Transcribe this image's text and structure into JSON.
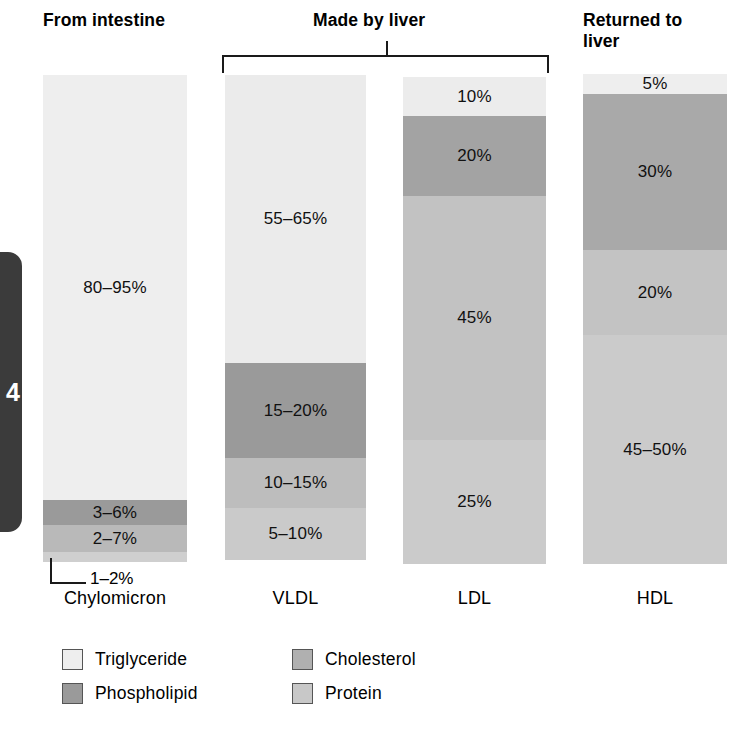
{
  "page_tab": {
    "number": "4"
  },
  "headings": {
    "intestine": "From intestine",
    "liver": "Made by liver",
    "returned": "Returned to\nliver"
  },
  "callout": {
    "label": "1–2%"
  },
  "captions": {
    "chylomicron": "Chylomicron",
    "vldl": "VLDL",
    "ldl": "LDL",
    "hdl": "HDL"
  },
  "legend": {
    "items": [
      {
        "label": "Triglyceride",
        "color": "#eeeeee"
      },
      {
        "label": "Cholesterol",
        "color": "#b0b0b0"
      },
      {
        "label": "Phospholipid",
        "color": "#9a9a9a"
      },
      {
        "label": "Protein",
        "color": "#c8c8c8"
      }
    ]
  },
  "chart_data": {
    "type": "bar",
    "xlabel": "",
    "ylabel": "Percent of particle mass",
    "ylim": [
      0,
      100
    ],
    "grid": false,
    "legend_position": "bottom",
    "categories": [
      "Chylomicron",
      "VLDL",
      "LDL",
      "HDL"
    ],
    "series": [
      {
        "name": "Triglyceride",
        "color": "#eeeeee",
        "labels": [
          "80–95%",
          "55–65%",
          "10%",
          "5%"
        ],
        "values": [
          87.5,
          60,
          10,
          5
        ]
      },
      {
        "name": "Phospholipid",
        "color": "#9a9a9a",
        "labels": [
          "3–6%",
          "15–20%",
          "20%",
          "30%"
        ],
        "values": [
          4.5,
          17.5,
          20,
          30
        ]
      },
      {
        "name": "Cholesterol",
        "color": "#b0b0b0",
        "labels": [
          "2–7%",
          "10–15%",
          "45%",
          "20%"
        ],
        "values": [
          4.5,
          12.5,
          45,
          20
        ]
      },
      {
        "name": "Protein",
        "color": "#c8c8c8",
        "labels": [
          "1–2%",
          "5–10%",
          "25%",
          "45–50%"
        ],
        "values": [
          1.5,
          7.5,
          25,
          47.5
        ]
      }
    ]
  },
  "bars": {
    "chylomicron": {
      "segments": [
        {
          "component": "Triglyceride",
          "label": "80–95%",
          "height_px": 425,
          "color": "#eeeeee"
        },
        {
          "component": "Phospholipid",
          "label": "3–6%",
          "height_px": 25,
          "color": "#9a9a9a"
        },
        {
          "component": "Cholesterol",
          "label": "2–7%",
          "height_px": 27,
          "color": "#b9b9b9"
        },
        {
          "component": "Protein",
          "label": "",
          "height_px": 10,
          "color": "#cfcfcf"
        }
      ]
    },
    "vldl": {
      "segments": [
        {
          "component": "Triglyceride",
          "label": "55–65%",
          "height_px": 288,
          "color": "#ebebeb"
        },
        {
          "component": "Phospholipid",
          "label": "15–20%",
          "height_px": 95,
          "color": "#9a9a9a"
        },
        {
          "component": "Cholesterol",
          "label": "10–15%",
          "height_px": 50,
          "color": "#bdbdbd"
        },
        {
          "component": "Protein",
          "label": "5–10%",
          "height_px": 52,
          "color": "#cacaca"
        }
      ]
    },
    "ldl": {
      "segments": [
        {
          "component": "Triglyceride",
          "label": "10%",
          "height_px": 39,
          "color": "#ececec"
        },
        {
          "component": "Phospholipid",
          "label": "20%",
          "height_px": 80,
          "color": "#a3a3a3"
        },
        {
          "component": "Cholesterol",
          "label": "45%",
          "height_px": 244,
          "color": "#c2c2c2"
        },
        {
          "component": "Protein",
          "label": "25%",
          "height_px": 124,
          "color": "#cbcbcb"
        }
      ]
    },
    "hdl": {
      "segments": [
        {
          "component": "Triglyceride",
          "label": "5%",
          "height_px": 20,
          "color": "#eeeeee"
        },
        {
          "component": "Phospholipid",
          "label": "30%",
          "height_px": 156,
          "color": "#a9a9a9"
        },
        {
          "component": "Cholesterol",
          "label": "20%",
          "height_px": 85,
          "color": "#c3c3c3"
        },
        {
          "component": "Protein",
          "label": "45–50%",
          "height_px": 229,
          "color": "#cbcbcb"
        }
      ]
    }
  }
}
